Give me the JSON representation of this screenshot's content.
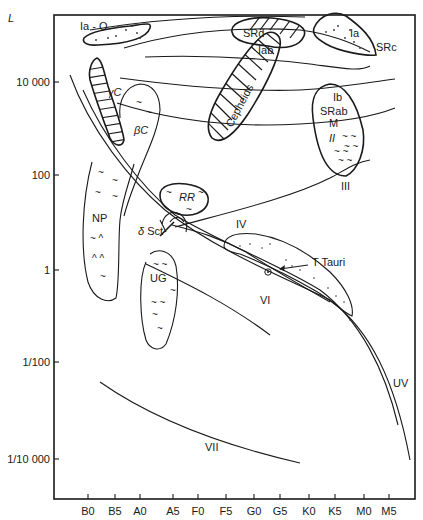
{
  "diagram": {
    "type": "Hertzsprung-Russell diagram (variable star regions)",
    "y_axis": {
      "label": "L",
      "ticks": [
        "10 000",
        "100",
        "1",
        "1/100",
        "1/10 000"
      ]
    },
    "x_axis": {
      "label": "",
      "ticks": [
        "B0",
        "B5",
        "A0",
        "A5",
        "F0",
        "F5",
        "G0",
        "G5",
        "K0",
        "K5",
        "M0",
        "M5"
      ]
    },
    "regions": {
      "ia_o": "Ia - O",
      "srd": "SRd",
      "iab": "Iab",
      "ia": "Ia",
      "src": "SRc",
      "cepheids": "Cepheids",
      "gamma_c": "γC",
      "beta_c": "βC",
      "ib": "Ib",
      "srab": "SRab",
      "m": "M",
      "ii": "II",
      "iii": "III",
      "np": "NP",
      "rr": "RR",
      "delta_sct": "δ Sct",
      "iv": "IV",
      "t_tauri": "T Tauri",
      "ug": "UG",
      "vi": "VI",
      "uv": "UV",
      "vii": "VII",
      "sun_symbol": "⊙"
    }
  }
}
